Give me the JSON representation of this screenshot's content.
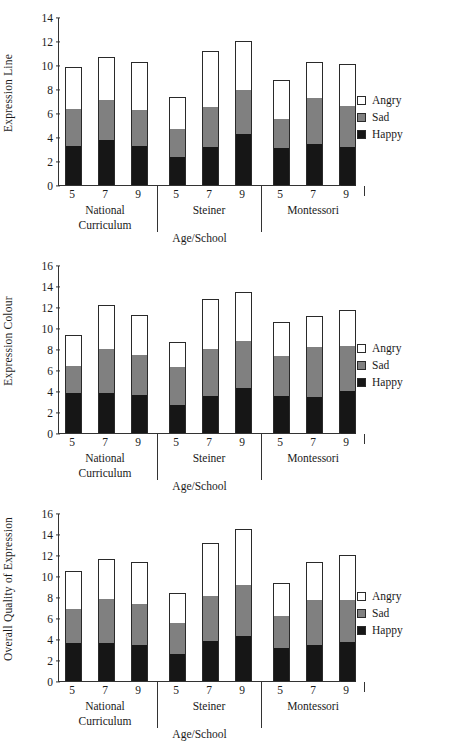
{
  "legend": {
    "items": [
      {
        "label": "Angry",
        "color": "#ffffff",
        "key": "angry"
      },
      {
        "label": "Sad",
        "color": "#808080",
        "key": "sad"
      },
      {
        "label": "Happy",
        "color": "#161616",
        "key": "happy"
      }
    ]
  },
  "axis": {
    "xlabel": "Age/School",
    "ages": [
      "5",
      "7",
      "9"
    ],
    "groups": [
      "National\nCurriculum",
      "Steiner",
      "Montessori"
    ],
    "group_lines": [
      "National",
      "Curriculum",
      "Steiner",
      "Montessori"
    ]
  },
  "chart_data": [
    {
      "type": "bar",
      "stacked": true,
      "title": "",
      "ylabel": "Expression Line",
      "xlabel": "Age/School",
      "ylim": [
        0,
        14
      ],
      "yticks": [
        0,
        2,
        4,
        6,
        8,
        10,
        12,
        14
      ],
      "grid": false,
      "legend_position": "right",
      "categories": [
        "5",
        "7",
        "9",
        "5",
        "7",
        "9",
        "5",
        "7",
        "9"
      ],
      "groups": [
        "National Curriculum",
        "National Curriculum",
        "National Curriculum",
        "Steiner",
        "Steiner",
        "Steiner",
        "Montessori",
        "Montessori",
        "Montessori"
      ],
      "series": [
        {
          "name": "Happy",
          "color": "#161616",
          "values": [
            3.35,
            3.8,
            3.3,
            2.45,
            3.25,
            4.3,
            3.2,
            3.5,
            3.25
          ]
        },
        {
          "name": "Sad",
          "color": "#808080",
          "values": [
            3.05,
            3.4,
            3.05,
            2.3,
            3.35,
            3.7,
            2.4,
            3.8,
            3.45
          ]
        },
        {
          "name": "Angry",
          "color": "#ffffff",
          "values": [
            3.5,
            3.55,
            4.0,
            2.65,
            4.65,
            4.05,
            3.2,
            3.0,
            3.45
          ]
        }
      ],
      "totals": [
        9.9,
        10.75,
        10.35,
        7.4,
        11.25,
        12.05,
        8.8,
        10.3,
        10.15
      ]
    },
    {
      "type": "bar",
      "stacked": true,
      "title": "",
      "ylabel": "Expression Colour",
      "xlabel": "Age/School",
      "ylim": [
        0,
        16
      ],
      "yticks": [
        0,
        2,
        4,
        6,
        8,
        10,
        12,
        14,
        16
      ],
      "grid": false,
      "legend_position": "right",
      "categories": [
        "5",
        "7",
        "9",
        "5",
        "7",
        "9",
        "5",
        "7",
        "9"
      ],
      "groups": [
        "National Curriculum",
        "National Curriculum",
        "National Curriculum",
        "Steiner",
        "Steiner",
        "Steiner",
        "Montessori",
        "Montessori",
        "Montessori"
      ],
      "series": [
        {
          "name": "Happy",
          "color": "#161616",
          "values": [
            3.9,
            3.9,
            3.75,
            2.75,
            3.65,
            4.35,
            3.65,
            3.5,
            4.05
          ]
        },
        {
          "name": "Sad",
          "color": "#808080",
          "values": [
            2.6,
            4.2,
            3.8,
            3.65,
            4.45,
            4.55,
            3.75,
            4.8,
            4.3
          ]
        },
        {
          "name": "Angry",
          "color": "#ffffff",
          "values": [
            2.95,
            4.15,
            3.8,
            2.35,
            4.75,
            4.6,
            3.3,
            2.9,
            3.45
          ]
        }
      ],
      "totals": [
        9.45,
        12.25,
        11.35,
        8.75,
        12.85,
        13.5,
        10.7,
        11.2,
        11.8
      ]
    },
    {
      "type": "bar",
      "stacked": true,
      "title": "",
      "ylabel": "Overall Quality of Expression",
      "xlabel": "Age/School",
      "ylim": [
        0,
        16
      ],
      "yticks": [
        0,
        2,
        4,
        6,
        8,
        10,
        12,
        14,
        16
      ],
      "grid": false,
      "legend_position": "right",
      "categories": [
        "5",
        "7",
        "9",
        "5",
        "7",
        "9",
        "5",
        "7",
        "9"
      ],
      "groups": [
        "National Curriculum",
        "National Curriculum",
        "National Curriculum",
        "Steiner",
        "Steiner",
        "Steiner",
        "Montessori",
        "Montessori",
        "Montessori"
      ],
      "series": [
        {
          "name": "Happy",
          "color": "#161616",
          "values": [
            3.75,
            3.7,
            3.5,
            2.7,
            3.95,
            4.35,
            3.25,
            3.55,
            3.8
          ]
        },
        {
          "name": "Sad",
          "color": "#808080",
          "values": [
            3.25,
            4.25,
            3.9,
            2.9,
            4.25,
            4.9,
            3.05,
            4.25,
            4.0
          ]
        },
        {
          "name": "Angry",
          "color": "#ffffff",
          "values": [
            3.55,
            3.8,
            4.05,
            2.9,
            5.05,
            5.3,
            3.1,
            3.6,
            4.3
          ]
        }
      ],
      "totals": [
        10.55,
        11.75,
        11.45,
        8.5,
        13.25,
        14.55,
        9.4,
        11.4,
        12.1
      ]
    }
  ]
}
